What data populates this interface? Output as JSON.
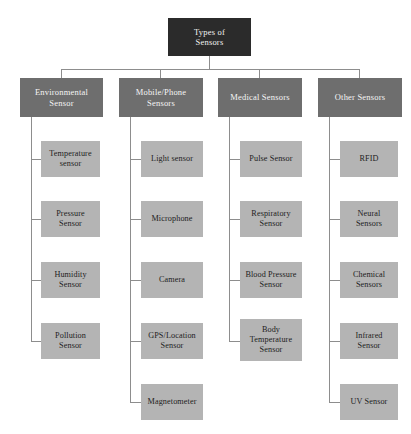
{
  "diagram": {
    "type": "hierarchy-tree",
    "title": "Types of Sensors",
    "colors": {
      "root_fill": "#2b2b2b",
      "root_text": "#f2f2f2",
      "category_fill": "#6e6e6e",
      "category_text": "#f5f5f5",
      "leaf_fill": "#b4b4b4",
      "leaf_text": "#1d1d1d",
      "connector": "#8d8d8d",
      "background": "#ffffff"
    },
    "root": {
      "label": "Types of\nSensors"
    },
    "categories": [
      {
        "label": "Environmental\nSensor",
        "children": [
          {
            "label": "Temperature\nsensor"
          },
          {
            "label": "Pressure\nSensor"
          },
          {
            "label": "Humidity\nSensor"
          },
          {
            "label": "Pollution\nSensor"
          }
        ]
      },
      {
        "label": "Mobile/Phone\nSensors",
        "children": [
          {
            "label": "Light  sensor"
          },
          {
            "label": "Microphone"
          },
          {
            "label": "Camera"
          },
          {
            "label": "GPS/Location\nSensor"
          },
          {
            "label": "Magnetometer"
          }
        ]
      },
      {
        "label": "Medical Sensors",
        "children": [
          {
            "label": "Pulse Sensor"
          },
          {
            "label": "Respiratory\nSensor"
          },
          {
            "label": "Blood Pressure\nSensor"
          },
          {
            "label": "Body\nTemperature\nSensor"
          }
        ]
      },
      {
        "label": "Other Sensors",
        "children": [
          {
            "label": "RFID"
          },
          {
            "label": "Neural\nSensors"
          },
          {
            "label": "Chemical\nSensors"
          },
          {
            "label": "Infrared\nSensor"
          },
          {
            "label": "UV Sensor"
          }
        ]
      }
    ]
  }
}
